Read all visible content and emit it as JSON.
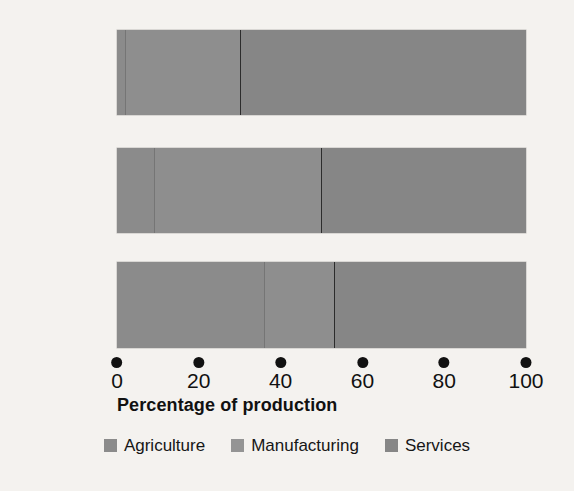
{
  "chart_data": {
    "type": "bar",
    "orientation": "horizontal",
    "stacked": true,
    "normalized_to_100": true,
    "title": "",
    "xlabel": "Percentage of production",
    "ylabel": "",
    "xlim": [
      0,
      100
    ],
    "xticks": [
      0,
      20,
      40,
      60,
      80,
      100
    ],
    "xtick_labels": [
      "0",
      "20",
      "40",
      "60",
      "80",
      "100"
    ],
    "grid": false,
    "legend_position": "bottom-center",
    "categories": [
      "Canada",
      "China",
      "Ethiopia"
    ],
    "series": [
      {
        "name": "Agriculture",
        "color": "#8b8b8b",
        "values": [
          2,
          9,
          36
        ]
      },
      {
        "name": "Manufacturing",
        "color": "#949494",
        "values": [
          28,
          41,
          17
        ]
      },
      {
        "name": "Services",
        "color": "#868686",
        "values": [
          70,
          50,
          47
        ]
      }
    ],
    "bars": [
      {
        "category": "Canada",
        "segments": [
          {
            "series": "Agriculture",
            "value": 2,
            "start": 0,
            "end": 2
          },
          {
            "series": "Manufacturing",
            "value": 28,
            "start": 2,
            "end": 30
          },
          {
            "series": "Services",
            "value": 70,
            "start": 30,
            "end": 100
          }
        ]
      },
      {
        "category": "China",
        "segments": [
          {
            "series": "Agriculture",
            "value": 9,
            "start": 0,
            "end": 9
          },
          {
            "series": "Manufacturing",
            "value": 41,
            "start": 9,
            "end": 50
          },
          {
            "series": "Services",
            "value": 50,
            "start": 50,
            "end": 100
          }
        ]
      },
      {
        "category": "Ethiopia",
        "segments": [
          {
            "series": "Agriculture",
            "value": 36,
            "start": 0,
            "end": 36
          },
          {
            "series": "Manufacturing",
            "value": 17,
            "start": 36,
            "end": 53
          },
          {
            "series": "Services",
            "value": 47,
            "start": 53,
            "end": 100
          }
        ]
      }
    ]
  },
  "axis": {
    "title": "Percentage of production"
  },
  "legend": {
    "items": [
      {
        "label": "Agriculture",
        "key": "agriculture"
      },
      {
        "label": "Manufacturing",
        "key": "manufacturing"
      },
      {
        "label": "Services",
        "key": "services"
      }
    ]
  },
  "colors": {
    "background": "#f4f2ef",
    "text": "#161616",
    "agriculture": "#8b8b8b",
    "manufacturing": "#949494",
    "services": "#868686",
    "divider_light": "rgba(60,60,60,0.30)",
    "divider_dark": "rgba(25,25,25,0.82)"
  }
}
